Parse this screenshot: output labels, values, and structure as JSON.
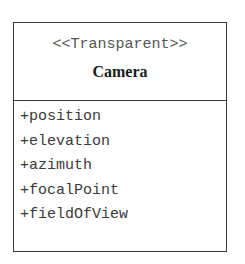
{
  "uml_class": {
    "stereotype": "<<Transparent>>",
    "name": "Camera",
    "attributes": [
      "+position",
      "+elevation",
      "+azimuth",
      "+focalPoint",
      "+fieldOfView"
    ]
  },
  "colors": {
    "border": "#3a3a3a",
    "stereotype_text": "#555555",
    "name_text": "#1a1a1a",
    "attribute_text": "#3a3a3a",
    "background": "#ffffff"
  }
}
